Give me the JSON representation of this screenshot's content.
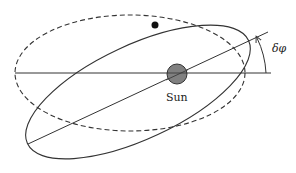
{
  "diagram": {
    "labels": {
      "sun": "Sun",
      "angle": "δφ"
    },
    "elements": {
      "sun": {
        "cx": 177,
        "cy": 74,
        "r": 10,
        "fill": "#808080"
      },
      "planet": {
        "cx": 155,
        "cy": 25,
        "r": 3.5,
        "fill": "#111111"
      },
      "original_orbit": {
        "style": "dashed",
        "cx": 130,
        "cy": 73,
        "rx": 115,
        "ry": 58,
        "rotation_deg": 0
      },
      "precessed_orbit": {
        "style": "solid",
        "cx": 138,
        "cy": 92,
        "rx": 122,
        "ry": 47,
        "rotation_deg": -25
      },
      "reference_axis": {
        "x1": 15,
        "y1": 73,
        "x2": 271,
        "y2": 73
      },
      "rotated_axis": {
        "x1": 28,
        "y1": 144,
        "x2": 268,
        "y2": 32
      }
    },
    "colors": {
      "line": "#333333",
      "sun": "#808080",
      "planet": "#111111"
    }
  }
}
